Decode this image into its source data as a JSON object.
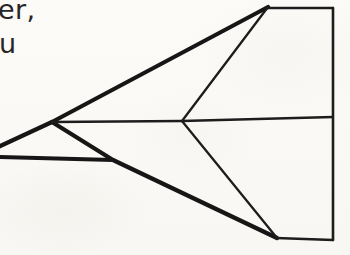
{
  "canvas": {
    "width": 350,
    "height": 255,
    "background_color": "#fbfaf7",
    "ink_color": "#1a1a1a"
  },
  "clipped_text": {
    "description": "Typeset text clipped at the left page margin, partially visible",
    "line_1": "er,",
    "line_2": "u"
  },
  "drawing": {
    "title": "Hand-drawn delta wing aircraft planform",
    "vertices": {
      "nose": [
        52,
        122
      ],
      "top_apex": [
        268,
        7
      ],
      "bottom_vertex": [
        277,
        238
      ],
      "center_junction": [
        182,
        121
      ],
      "lower_left_junction": [
        113,
        160
      ],
      "trailing_top": [
        333,
        8
      ],
      "trailing_mid": [
        333,
        117
      ],
      "trailing_bottom": [
        333,
        240
      ]
    },
    "strokes": [
      {
        "name": "upper-leading-edge",
        "weight": "thick",
        "points": [
          [
            0,
            147
          ],
          [
            52,
            122
          ],
          [
            268,
            7
          ]
        ]
      },
      {
        "name": "lower-leading-edge",
        "weight": "thick",
        "points": [
          [
            52,
            122
          ],
          [
            113,
            160
          ],
          [
            277,
            238
          ]
        ]
      },
      {
        "name": "lower-left-horizontal",
        "weight": "thick",
        "points": [
          [
            0,
            157
          ],
          [
            113,
            160
          ]
        ]
      },
      {
        "name": "fuselage-centerline",
        "weight": "thin",
        "points": [
          [
            52,
            122
          ],
          [
            182,
            121
          ],
          [
            333,
            117
          ]
        ]
      },
      {
        "name": "upper-inner-rib",
        "weight": "thin",
        "points": [
          [
            182,
            121
          ],
          [
            268,
            7
          ]
        ]
      },
      {
        "name": "lower-inner-rib",
        "weight": "thin",
        "points": [
          [
            182,
            121
          ],
          [
            277,
            238
          ]
        ]
      },
      {
        "name": "top-trailing-horizontal",
        "weight": "thin",
        "points": [
          [
            268,
            7
          ],
          [
            333,
            8
          ]
        ]
      },
      {
        "name": "bottom-trailing-horizontal",
        "weight": "thin",
        "points": [
          [
            277,
            238
          ],
          [
            333,
            240
          ]
        ]
      },
      {
        "name": "trailing-vertical-edge",
        "weight": "thin",
        "points": [
          [
            333,
            8
          ],
          [
            333,
            240
          ]
        ]
      }
    ]
  }
}
